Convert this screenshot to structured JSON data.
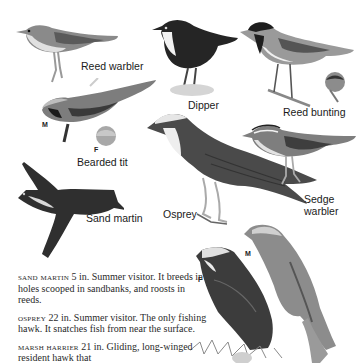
{
  "birds": [
    {
      "id": "reed-warbler",
      "label": "Reed warbler"
    },
    {
      "id": "dipper",
      "label": "Dipper"
    },
    {
      "id": "reed-bunting",
      "label": "Reed bunting"
    },
    {
      "id": "bearded-tit",
      "label": "Bearded tit",
      "sex_labels": [
        "M",
        "F"
      ]
    },
    {
      "id": "sedge-warbler",
      "label_line1": "Sedge",
      "label_line2": "warbler"
    },
    {
      "id": "sand-martin",
      "label": "Sand martin"
    },
    {
      "id": "osprey",
      "label": "Osprey"
    },
    {
      "id": "marsh-harrier",
      "sex_labels": [
        "M",
        "F"
      ]
    }
  ],
  "descriptions": [
    {
      "name": "sand martin",
      "text": " 5 in. Summer visitor. It breeds in holes scooped in sandbanks, and roosts in reeds."
    },
    {
      "name": "osprey",
      "text": " 22 in. Summer visitor. The only fishing hawk. It snatches fish from near the surface."
    },
    {
      "name": "marsh harrier",
      "text": " 21 in. Gliding, long-winged resident hawk that"
    }
  ],
  "colors": {
    "ink": "#1a1a1a",
    "dark": "#2b2b2b",
    "mid": "#6a6a6a",
    "light": "#b5b5b5",
    "pale": "#e4e4e4",
    "paper": "#ffffff"
  }
}
